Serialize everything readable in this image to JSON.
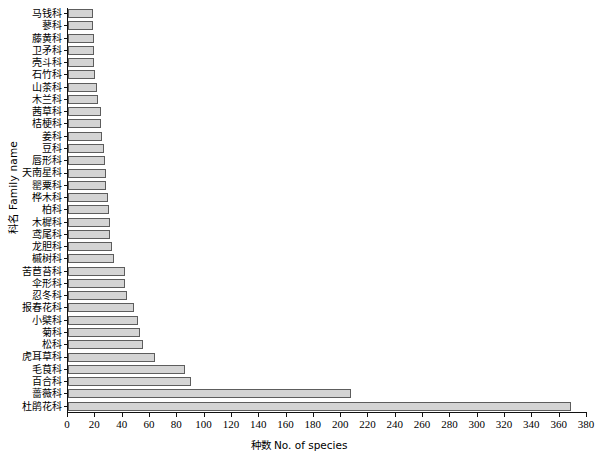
{
  "chart_data": {
    "type": "bar",
    "orientation": "horizontal",
    "title": "",
    "xlabel": "种数 No. of species",
    "ylabel": "科名 Family name",
    "xlim": [
      0,
      380
    ],
    "xticks": [
      0,
      20,
      40,
      60,
      80,
      100,
      120,
      140,
      160,
      180,
      200,
      220,
      240,
      260,
      280,
      300,
      320,
      340,
      360,
      380
    ],
    "grid": false,
    "legend": null,
    "bar_fill": "#d4d4d4",
    "bar_edge": "#5d5d5d",
    "categories": [
      "马钱科",
      "蓼科",
      "藤黄科",
      "卫矛科",
      "壳斗科",
      "石竹科",
      "山茶科",
      "木兰科",
      "茜草科",
      "桔梗科",
      "姜科",
      "豆科",
      "唇形科",
      "天南星科",
      "罂粟科",
      "桦木科",
      "柏科",
      "木樨科",
      "鸢尾科",
      "龙胆科",
      "槭树科",
      "苦苣苔科",
      "伞形科",
      "忍冬科",
      "报春花科",
      "小檗科",
      "菊科",
      "松科",
      "虎耳草科",
      "毛茛科",
      "百合科",
      "蔷薇科",
      "杜鹃花科"
    ],
    "values": [
      18,
      18,
      19,
      19,
      19,
      20,
      21,
      22,
      24,
      24,
      25,
      26,
      27,
      28,
      28,
      29,
      30,
      31,
      31,
      32,
      34,
      42,
      42,
      43,
      48,
      51,
      53,
      55,
      64,
      86,
      90,
      207,
      368
    ]
  }
}
